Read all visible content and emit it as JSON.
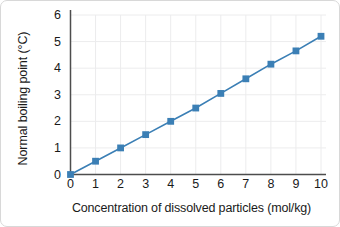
{
  "chart_data": {
    "type": "line",
    "title": "",
    "subtitle": "",
    "xlabel": "Concentration of dissolved particles (mol/kg)",
    "ylabel": "Normal boiling point (°C)",
    "x": [
      0,
      1,
      2,
      3,
      4,
      5,
      6,
      7,
      8,
      9,
      10
    ],
    "xtick_labels": [
      "0",
      "1",
      "2",
      "3",
      "4",
      "5",
      "6",
      "7",
      "8",
      "9",
      "10"
    ],
    "ytick_labels": [
      "0",
      "1",
      "2",
      "3",
      "4",
      "5",
      "6"
    ],
    "yticks": [
      0,
      1,
      2,
      3,
      4,
      5,
      6
    ],
    "xlim": [
      0,
      10.6
    ],
    "ylim": [
      0,
      6
    ],
    "grid": true,
    "legend": false,
    "legend_position": "none",
    "series": [
      {
        "name": "Normal boiling point",
        "values": [
          0.0,
          0.5,
          1.0,
          1.5,
          2.0,
          2.5,
          3.05,
          3.6,
          4.15,
          4.65,
          5.2
        ],
        "color": "#3b7fb5",
        "marker": "square",
        "marker_size": 3.4,
        "line_width": 1.6
      }
    ],
    "colors": {
      "line": "#3b7fb5",
      "marker": "#3b7fb5",
      "axis": "#4d4d4d",
      "grid": "#ececed",
      "text": "#1a1a1a",
      "background": "#ffffff",
      "border": "#d8d8d8"
    }
  }
}
